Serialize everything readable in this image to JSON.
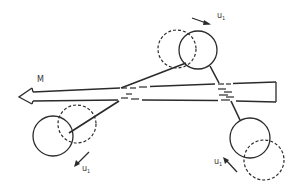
{
  "diagram": {
    "type": "mechanism-schematic",
    "moment_label": "M",
    "velocity_labels": {
      "top": "u",
      "top_sub": "1",
      "bottom_left": "u",
      "bottom_left_sub": "1",
      "bottom_right": "u",
      "bottom_right_sub": "1"
    },
    "colors": {
      "line": "#2b2b2b",
      "background": "#ffffff"
    },
    "elements": [
      {
        "name": "moment-arrow",
        "label": "M",
        "direction": "left"
      },
      {
        "name": "top-body",
        "solid_center": [
          198,
          50
        ],
        "dashed_center": [
          177,
          49
        ],
        "radius": 19
      },
      {
        "name": "bottom-left-body",
        "solid_center": [
          53,
          136
        ],
        "dashed_center": [
          77,
          124
        ],
        "radius": 20
      },
      {
        "name": "bottom-right-body",
        "solid_center": [
          250,
          138
        ],
        "dashed_center": [
          264,
          160
        ],
        "radius": 20
      }
    ]
  }
}
